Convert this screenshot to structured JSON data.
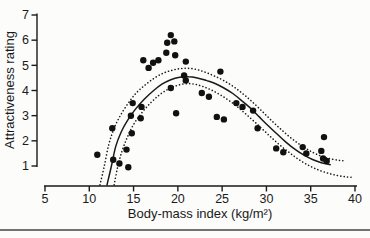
{
  "figure": {
    "background": "#fcfcfa",
    "ink": "#1a1a1a",
    "rule_color": "#454545"
  },
  "chart_data": {
    "type": "scatter",
    "title": "",
    "xlabel": "Body-mass index (kg/m²)",
    "ylabel": "Attractiveness rating",
    "xlim": [
      5,
      40
    ],
    "ylim": [
      1,
      7
    ],
    "xticks": [
      5,
      10,
      15,
      20,
      25,
      30,
      35,
      40
    ],
    "yticks": [
      1,
      2,
      3,
      4,
      5,
      6,
      7
    ],
    "grid": false,
    "legend_position": "none",
    "point_color": "#111111",
    "line_color": "#1a1a1a",
    "series": [
      {
        "name": "observed-attractiveness-ratings",
        "type": "scatter",
        "points": [
          [
            10.9,
            1.45
          ],
          [
            12.6,
            2.5
          ],
          [
            12.7,
            1.25
          ],
          [
            13.4,
            1.1
          ],
          [
            14.2,
            1.65
          ],
          [
            14.4,
            0.95
          ],
          [
            14.8,
            2.3
          ],
          [
            14.7,
            3.0
          ],
          [
            14.9,
            3.5
          ],
          [
            15.8,
            2.9
          ],
          [
            15.9,
            3.35
          ],
          [
            16.1,
            5.2
          ],
          [
            16.7,
            4.9
          ],
          [
            17.2,
            5.1
          ],
          [
            17.8,
            5.2
          ],
          [
            18.7,
            5.5
          ],
          [
            18.8,
            5.9
          ],
          [
            19.2,
            6.2
          ],
          [
            19.6,
            5.95
          ],
          [
            19.7,
            5.4
          ],
          [
            19.2,
            4.1
          ],
          [
            19.8,
            3.1
          ],
          [
            20.7,
            4.6
          ],
          [
            20.9,
            5.15
          ],
          [
            20.9,
            4.4
          ],
          [
            22.7,
            3.9
          ],
          [
            23.5,
            3.75
          ],
          [
            24.4,
            2.95
          ],
          [
            24.8,
            4.75
          ],
          [
            25.2,
            2.85
          ],
          [
            26.6,
            3.5
          ],
          [
            27.3,
            3.35
          ],
          [
            28.5,
            3.2
          ],
          [
            29.0,
            2.5
          ],
          [
            31.1,
            1.7
          ],
          [
            31.9,
            1.55
          ],
          [
            34.1,
            1.75
          ],
          [
            34.5,
            1.5
          ],
          [
            36.2,
            1.6
          ],
          [
            36.4,
            1.3
          ],
          [
            36.5,
            2.15
          ],
          [
            36.8,
            1.2
          ]
        ]
      },
      {
        "name": "fitted-curve",
        "type": "line",
        "style": "solid",
        "points": [
          [
            12.0,
            0.25
          ],
          [
            12.5,
            1.0
          ],
          [
            13.0,
            1.8
          ],
          [
            13.6,
            2.35
          ],
          [
            14.3,
            2.8
          ],
          [
            15.2,
            3.25
          ],
          [
            16.2,
            3.65
          ],
          [
            17.2,
            3.98
          ],
          [
            18.2,
            4.25
          ],
          [
            19.2,
            4.43
          ],
          [
            20.2,
            4.53
          ],
          [
            21.2,
            4.55
          ],
          [
            22.2,
            4.5
          ],
          [
            23.2,
            4.4
          ],
          [
            24.2,
            4.28
          ],
          [
            25.2,
            4.1
          ],
          [
            26.2,
            3.88
          ],
          [
            27.2,
            3.6
          ],
          [
            28.2,
            3.3
          ],
          [
            29.2,
            2.95
          ],
          [
            30.2,
            2.6
          ],
          [
            31.2,
            2.27
          ],
          [
            32.2,
            1.95
          ],
          [
            33.2,
            1.67
          ],
          [
            34.2,
            1.44
          ],
          [
            35.2,
            1.26
          ],
          [
            36.2,
            1.13
          ],
          [
            37.2,
            1.05
          ]
        ]
      },
      {
        "name": "confidence-band-upper",
        "type": "line",
        "style": "dotted",
        "points": [
          [
            11.2,
            0.25
          ],
          [
            11.7,
            1.0
          ],
          [
            12.2,
            1.85
          ],
          [
            12.8,
            2.5
          ],
          [
            13.5,
            3.0
          ],
          [
            14.4,
            3.5
          ],
          [
            15.3,
            3.9
          ],
          [
            16.3,
            4.22
          ],
          [
            17.3,
            4.48
          ],
          [
            18.3,
            4.68
          ],
          [
            19.3,
            4.8
          ],
          [
            20.3,
            4.87
          ],
          [
            21.3,
            4.88
          ],
          [
            22.3,
            4.82
          ],
          [
            23.3,
            4.7
          ],
          [
            24.3,
            4.55
          ],
          [
            25.3,
            4.37
          ],
          [
            26.3,
            4.15
          ],
          [
            27.3,
            3.88
          ],
          [
            28.3,
            3.58
          ],
          [
            29.3,
            3.25
          ],
          [
            30.3,
            2.9
          ],
          [
            31.3,
            2.57
          ],
          [
            32.3,
            2.25
          ],
          [
            33.3,
            1.97
          ],
          [
            34.3,
            1.73
          ],
          [
            35.3,
            1.53
          ],
          [
            36.3,
            1.38
          ],
          [
            37.3,
            1.28
          ],
          [
            38.3,
            1.22
          ],
          [
            39.0,
            1.2
          ]
        ]
      },
      {
        "name": "confidence-band-lower",
        "type": "line",
        "style": "dotted",
        "points": [
          [
            12.8,
            0.25
          ],
          [
            13.2,
            0.95
          ],
          [
            13.7,
            1.6
          ],
          [
            14.3,
            2.15
          ],
          [
            15.0,
            2.65
          ],
          [
            15.9,
            3.1
          ],
          [
            16.9,
            3.5
          ],
          [
            17.9,
            3.82
          ],
          [
            18.9,
            4.05
          ],
          [
            19.9,
            4.2
          ],
          [
            20.9,
            4.27
          ],
          [
            21.9,
            4.25
          ],
          [
            22.9,
            4.15
          ],
          [
            23.9,
            4.0
          ],
          [
            24.9,
            3.8
          ],
          [
            25.9,
            3.57
          ],
          [
            26.9,
            3.3
          ],
          [
            27.9,
            3.0
          ],
          [
            28.9,
            2.68
          ],
          [
            29.9,
            2.35
          ],
          [
            30.9,
            2.02
          ],
          [
            31.9,
            1.72
          ],
          [
            32.9,
            1.45
          ],
          [
            33.9,
            1.2
          ],
          [
            34.9,
            1.0
          ],
          [
            35.9,
            0.84
          ],
          [
            36.9,
            0.72
          ],
          [
            37.9,
            0.63
          ],
          [
            38.9,
            0.57
          ],
          [
            39.6,
            0.55
          ]
        ]
      }
    ]
  }
}
